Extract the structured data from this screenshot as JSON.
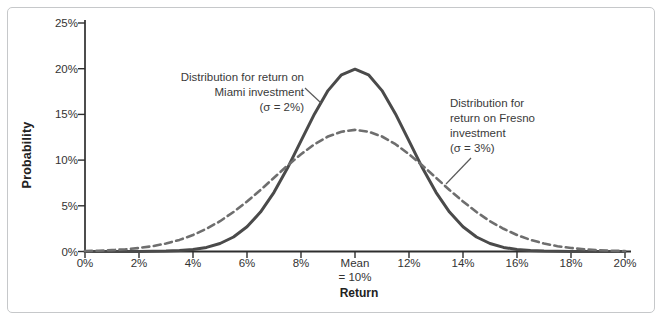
{
  "colors": {
    "miami_curve": "#4a4a4a",
    "fresno_curve": "#6e6e6e",
    "axis": "#2e2e2e",
    "tick_text": "#333333",
    "annotation_text": "#3a3a3a",
    "frame_border": "#c6c8ca",
    "leader_line": "#5a5a5a"
  },
  "annotations": {
    "miami": {
      "text": "Distribution for return on\nMiami investment\n(σ = 2%)"
    },
    "fresno": {
      "text": "Distribution for\nreturn on Fresno\ninvestment\n(σ = 3%)"
    }
  },
  "chart_data": {
    "type": "line",
    "title": "",
    "xlabel": "Return",
    "ylabel": "Probability",
    "xlim": [
      0,
      20
    ],
    "ylim": [
      0,
      25
    ],
    "grid": false,
    "legend_position": "inline-annotations",
    "x_tick_values": [
      0,
      2,
      4,
      6,
      8,
      10,
      12,
      14,
      16,
      18,
      20
    ],
    "x_tick_labels": [
      "0%",
      "2%",
      "4%",
      "6%",
      "8%",
      "Mean\n= 10%",
      "12%",
      "14%",
      "16%",
      "18%",
      "20%"
    ],
    "y_tick_values": [
      0,
      5,
      10,
      15,
      20,
      25
    ],
    "y_tick_labels": [
      "0%",
      "5%",
      "10%",
      "15%",
      "20%",
      "25%"
    ],
    "series": [
      {
        "name": "Miami",
        "description": "Distribution for return on Miami investment",
        "mean_percent": 10,
        "sigma_percent": 2,
        "style": "solid",
        "color": "#4a4a4a",
        "x_start": 0,
        "x_step": 0.5,
        "y": [
          0,
          0,
          0,
          0,
          0.01,
          0.02,
          0.04,
          0.1,
          0.22,
          0.45,
          0.88,
          1.59,
          2.7,
          4.31,
          6.48,
          9.13,
          12.1,
          15.06,
          17.6,
          19.33,
          19.95,
          19.33,
          17.6,
          15.06,
          12.1,
          9.13,
          6.48,
          4.31,
          2.7,
          1.59,
          0.88,
          0.45,
          0.22,
          0.1,
          0.04,
          0.02,
          0.01,
          0,
          0,
          0,
          0
        ]
      },
      {
        "name": "Fresno",
        "description": "Distribution for return on Fresno investment",
        "mean_percent": 10,
        "sigma_percent": 3,
        "style": "dashed",
        "color": "#6e6e6e",
        "x_start": 0,
        "x_step": 0.5,
        "y": [
          0.05,
          0.09,
          0.15,
          0.24,
          0.38,
          0.58,
          0.87,
          1.27,
          1.8,
          2.48,
          3.32,
          4.32,
          5.47,
          6.73,
          8.07,
          9.4,
          10.65,
          11.74,
          12.58,
          13.11,
          13.3,
          13.11,
          12.58,
          11.74,
          10.65,
          9.4,
          8.07,
          6.73,
          5.47,
          4.32,
          3.32,
          2.48,
          1.8,
          1.27,
          0.87,
          0.58,
          0.38,
          0.24,
          0.15,
          0.09,
          0.05
        ]
      }
    ]
  }
}
